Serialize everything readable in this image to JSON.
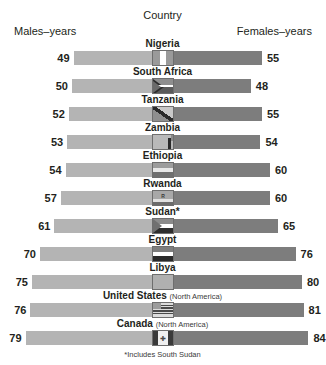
{
  "header": {
    "country": "Country",
    "males": "Males–years",
    "females": "Females–years"
  },
  "footnote": "*Includes South Sudan",
  "colors": {
    "male_bar": "#b4b4b4",
    "female_bar": "#7d7d7d",
    "text": "#231f20",
    "background": "#ffffff"
  },
  "chart_data": {
    "type": "bar",
    "title": "",
    "subtitle": "",
    "xlabel": "",
    "ylabel": "Country",
    "orientation": "horizontal-diverging",
    "grid": false,
    "legend_position": "top",
    "categories": [
      "Nigeria",
      "South Africa",
      "Tanzania",
      "Zambia",
      "Ethiopia",
      "Rwanda",
      "Sudan*",
      "Egypt",
      "Libya",
      "United States",
      "Canada"
    ],
    "series": [
      {
        "name": "Males–years",
        "values": [
          49,
          50,
          52,
          53,
          54,
          57,
          61,
          70,
          75,
          76,
          79
        ]
      },
      {
        "name": "Females–years",
        "values": [
          55,
          48,
          55,
          54,
          60,
          60,
          65,
          76,
          80,
          81,
          84
        ]
      }
    ],
    "xlim": [
      0,
      90
    ],
    "annotations": [
      "*Includes South Sudan"
    ]
  },
  "rows": [
    {
      "country": "Nigeria",
      "region": "",
      "male": "49",
      "female": "55",
      "flag": "nigeria-flag"
    },
    {
      "country": "South Africa",
      "region": "",
      "male": "50",
      "female": "48",
      "flag": "south-africa-flag"
    },
    {
      "country": "Tanzania",
      "region": "",
      "male": "52",
      "female": "55",
      "flag": "tanzania-flag"
    },
    {
      "country": "Zambia",
      "region": "",
      "male": "53",
      "female": "54",
      "flag": "zambia-flag"
    },
    {
      "country": "Ethiopia",
      "region": "",
      "male": "54",
      "female": "60",
      "flag": "ethiopia-flag"
    },
    {
      "country": "Rwanda",
      "region": "",
      "male": "57",
      "female": "60",
      "flag": "rwanda-flag"
    },
    {
      "country": "Sudan*",
      "region": "",
      "male": "61",
      "female": "65",
      "flag": "sudan-flag"
    },
    {
      "country": "Egypt",
      "region": "",
      "male": "70",
      "female": "76",
      "flag": "egypt-flag"
    },
    {
      "country": "Libya",
      "region": "",
      "male": "75",
      "female": "80",
      "flag": "libya-flag"
    },
    {
      "country": "United States",
      "region": "(North America)",
      "male": "76",
      "female": "81",
      "flag": "united-states-flag"
    },
    {
      "country": "Canada",
      "region": "(North America)",
      "male": "79",
      "female": "84",
      "flag": "canada-flag"
    }
  ]
}
